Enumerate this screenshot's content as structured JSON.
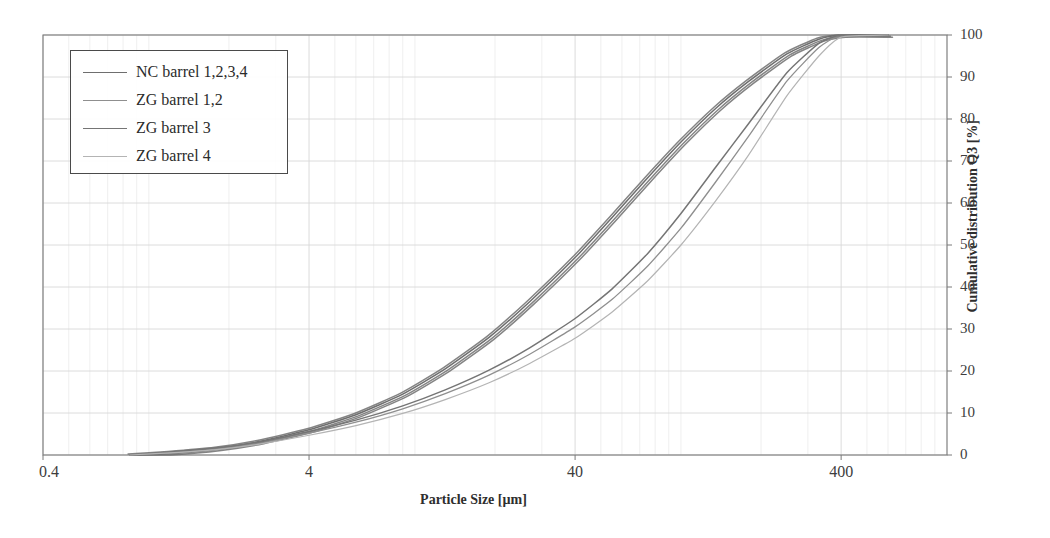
{
  "chart_data": {
    "type": "line",
    "title": "",
    "xlabel": "Particle Size [µm]",
    "ylabel": "Cumulative distribution Q3 [%]",
    "x_scale": "log",
    "xlim": [
      0.4,
      1000
    ],
    "ylim": [
      0,
      105
    ],
    "xticks": [
      0.4,
      4,
      40,
      400
    ],
    "xtick_labels": [
      "0.4",
      "4",
      "40",
      "400"
    ],
    "yticks": [
      0,
      10,
      20,
      30,
      40,
      50,
      60,
      70,
      80,
      90,
      100
    ],
    "ytick_labels": [
      "0",
      "10",
      "20",
      "30",
      "40",
      "50",
      "60",
      "70",
      "80",
      "90",
      "100"
    ],
    "y_axis_position": "right",
    "grid": true,
    "grid_minor_x": true,
    "legend_position": "upper left",
    "series": [
      {
        "name": "NC barrel 1,2,3,4",
        "color": "#6e6e6e",
        "width": 1.5,
        "x": [
          0.85,
          1.2,
          1.8,
          2.6,
          4.0,
          6.0,
          9.0,
          13.0,
          19.0,
          27.0,
          40.0,
          55.0,
          75.0,
          100.0,
          135.0,
          180.0,
          250.0,
          330.0,
          400.0,
          600.0
        ],
        "y": [
          0.0,
          0.6,
          1.6,
          3.2,
          6.0,
          9.6,
          14.5,
          20.5,
          28.0,
          36.5,
          47.0,
          56.5,
          66.0,
          74.5,
          82.5,
          89.0,
          95.5,
          99.0,
          100.0,
          100.0
        ]
      },
      {
        "name": "ZG barrel 1,2",
        "color": "#8f8f8f",
        "width": 1.3,
        "x": [
          0.85,
          1.2,
          1.8,
          2.6,
          4.0,
          6.0,
          9.0,
          13.0,
          19.0,
          27.0,
          40.0,
          55.0,
          75.0,
          100.0,
          135.0,
          180.0,
          250.0,
          330.0,
          400.0,
          600.0
        ],
        "y": [
          0.0,
          0.6,
          1.5,
          2.9,
          5.2,
          7.8,
          11.0,
          14.6,
          19.0,
          24.0,
          30.5,
          37.0,
          45.0,
          54.0,
          65.0,
          76.0,
          89.0,
          97.0,
          100.0,
          100.0
        ]
      },
      {
        "name": "ZG barrel 3",
        "color": "#757575",
        "width": 1.5,
        "x": [
          0.85,
          1.2,
          1.8,
          2.6,
          4.0,
          6.0,
          9.0,
          13.0,
          19.0,
          27.0,
          40.0,
          55.0,
          75.0,
          100.0,
          135.0,
          180.0,
          250.0,
          330.0,
          400.0,
          600.0
        ],
        "y": [
          0.0,
          0.7,
          1.7,
          3.1,
          5.6,
          8.3,
          11.7,
          15.5,
          20.2,
          25.5,
          32.5,
          39.5,
          48.0,
          57.5,
          68.5,
          79.0,
          91.0,
          98.0,
          100.0,
          100.0
        ]
      },
      {
        "name": "ZG barrel 4",
        "color": "#b4b4b4",
        "width": 1.2,
        "x": [
          0.85,
          1.2,
          1.8,
          2.6,
          4.0,
          6.0,
          9.0,
          13.0,
          19.0,
          27.0,
          40.0,
          55.0,
          75.0,
          100.0,
          135.0,
          180.0,
          250.0,
          330.0,
          400.0,
          600.0
        ],
        "y": [
          0.0,
          0.5,
          1.3,
          2.6,
          4.7,
          7.0,
          9.9,
          13.2,
          17.2,
          21.8,
          27.8,
          34.0,
          41.5,
          50.0,
          60.5,
          71.5,
          85.5,
          95.0,
          99.5,
          100.0
        ]
      }
    ]
  },
  "axes": {
    "x_title": "Particle Size [µm]",
    "y_title": "Cumulative distribution Q3 [%]"
  },
  "legend": {
    "items": [
      {
        "label": "NC barrel 1,2,3,4",
        "color": "#6e6e6e"
      },
      {
        "label": "ZG barrel 1,2",
        "color": "#8f8f8f"
      },
      {
        "label": "ZG barrel 3",
        "color": "#757575"
      },
      {
        "label": "ZG barrel 4",
        "color": "#b4b4b4"
      }
    ]
  },
  "style": {
    "frame_color": "#7a7a7a",
    "grid_color": "#d8d8d8",
    "grid_minor_color": "#e8e8e8",
    "background": "#ffffff"
  }
}
